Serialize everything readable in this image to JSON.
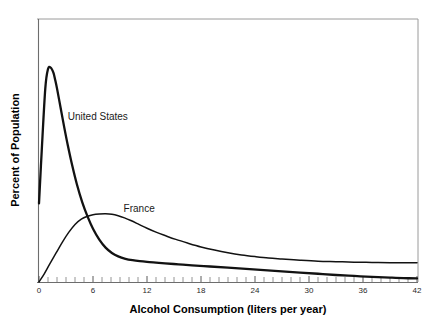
{
  "chart_data": {
    "type": "line",
    "title": "",
    "subtitle": "",
    "xlabel": "Alcohol Consumption (liters per year)",
    "ylabel": "Percent of Population",
    "xlim": [
      0,
      42
    ],
    "ylim": [
      0,
      100
    ],
    "grid": false,
    "legend_position": "inline-annotations",
    "x_ticks": [
      0,
      6,
      12,
      18,
      24,
      30,
      36,
      42
    ],
    "x_tick_labels": [
      "0",
      "6",
      "12",
      "18",
      "24",
      "30",
      "36",
      "42"
    ],
    "x_minor_tick_interval": 1,
    "y_ticks": [],
    "y_tick_labels": [],
    "annotations": [
      {
        "text": "United States",
        "x": 3.2,
        "y": 67
      },
      {
        "text": "France",
        "x": 9.4,
        "y": 29
      }
    ],
    "series": [
      {
        "name": "United States",
        "color": "#121212",
        "line_width": 2.3,
        "x": [
          0.0,
          0.3,
          0.7,
          1.0,
          1.3,
          1.6,
          1.8,
          2.0,
          2.4,
          2.8,
          3.2,
          3.7,
          4.2,
          4.8,
          5.4,
          6.0,
          6.7,
          7.4,
          8.1,
          8.8,
          9.6,
          10.4,
          11.2,
          12.0,
          13.0,
          14.0,
          15.5,
          17.0,
          19.0,
          21.0,
          23.0,
          25.0,
          27.0,
          29.0,
          31.0,
          33.0,
          35.0,
          37.0,
          39.0,
          40.5,
          42.0
        ],
        "y": [
          32.5,
          54.0,
          80.0,
          88.0,
          88.6,
          86.5,
          83.5,
          80.0,
          72.0,
          64.0,
          56.5,
          48.0,
          40.5,
          33.0,
          27.0,
          22.0,
          17.5,
          14.2,
          12.0,
          10.6,
          9.6,
          9.0,
          8.6,
          8.3,
          8.0,
          7.7,
          7.3,
          6.9,
          6.4,
          5.9,
          5.4,
          4.9,
          4.4,
          3.9,
          3.4,
          2.9,
          2.5,
          2.1,
          1.8,
          1.6,
          1.5
        ]
      },
      {
        "name": "France",
        "color": "#121212",
        "line_width": 1.5,
        "x": [
          0.0,
          0.6,
          1.2,
          1.9,
          2.6,
          3.3,
          4.0,
          4.7,
          5.4,
          6.0,
          6.7,
          7.4,
          8.1,
          8.8,
          9.5,
          10.2,
          11.0,
          12.0,
          13.0,
          14.0,
          15.2,
          16.5,
          18.0,
          19.5,
          21.0,
          22.5,
          24.0,
          25.5,
          27.0,
          29.0,
          31.0,
          33.0,
          35.0,
          37.0,
          39.0,
          40.5,
          42.0
        ],
        "y": [
          0.0,
          3.5,
          7.5,
          12.0,
          16.5,
          20.5,
          23.8,
          26.0,
          27.2,
          27.8,
          28.1,
          28.2,
          28.0,
          27.4,
          26.5,
          25.4,
          24.0,
          22.2,
          20.6,
          19.2,
          17.6,
          16.1,
          14.5,
          13.2,
          12.1,
          11.2,
          10.5,
          9.9,
          9.5,
          9.0,
          8.6,
          8.4,
          8.2,
          8.1,
          8.0,
          8.0,
          8.0
        ]
      }
    ]
  },
  "figure": {
    "background_color": "#ffffff",
    "axis_color": "#6d6d6d",
    "frame_color": "#9a9a9a",
    "curve_color": "#121212"
  }
}
